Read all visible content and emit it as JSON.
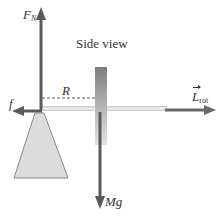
{
  "diagram": {
    "title": "Side view",
    "labels": {
      "normal_force": "F",
      "normal_force_sub": "N",
      "radius": "R",
      "friction": "f",
      "angular_momentum": "L",
      "angular_momentum_sub": "rot",
      "weight": "Mg"
    },
    "colors": {
      "arrow": "#5a5a5a",
      "axle": "#d6d6d6",
      "pivot_fill": "#dcdcdc",
      "pivot_stroke": "#8a8a8a",
      "wheel_top": "#7a7a7a",
      "wheel_bottom": "#d8d8d8",
      "text": "#333333"
    },
    "icons": {
      "normal_force_arrow": "arrow-up",
      "friction_arrow": "arrow-left",
      "angular_momentum_arrow": "arrow-right",
      "weight_arrow": "arrow-down",
      "radius_line": "dashed-line",
      "pivot_stand": "trapezoid",
      "wheel": "gradient-bar"
    }
  }
}
